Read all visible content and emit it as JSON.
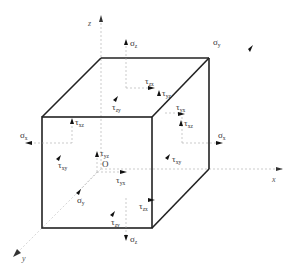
{
  "diagram": {
    "title": "",
    "type": "stress-element-cube",
    "colors": {
      "edge": "#222222",
      "axis": "#999999",
      "arrow": "#111111",
      "text": "#333333",
      "background": "#ffffff"
    },
    "axes": {
      "x": "x",
      "y": "y",
      "z": "z"
    },
    "origin": "O",
    "labels": {
      "top_sigma_z": {
        "sym": "σ",
        "sub": "z"
      },
      "top_tau_zx": {
        "sym": "τ",
        "sub": "zx"
      },
      "top_tau_zy": {
        "sym": "τ",
        "sub": "zy"
      },
      "back_sigma_y": {
        "sym": "σ",
        "sub": "y"
      },
      "back_tau_yz": {
        "sym": "τ",
        "sub": "yz"
      },
      "right_tau_yx": {
        "sym": "τ",
        "sub": "yx"
      },
      "right_tau_xz": {
        "sym": "τ",
        "sub": "xz"
      },
      "right_sigma_x": {
        "sym": "σ",
        "sub": "x"
      },
      "right_tau_xy": {
        "sym": "τ",
        "sub": "xy"
      },
      "left_sigma_x": {
        "sym": "σ",
        "sub": "x"
      },
      "left_tau_xz": {
        "sym": "τ",
        "sub": "xz"
      },
      "left_tau_xy": {
        "sym": "τ",
        "sub": "xy"
      },
      "inner_tau_yz": {
        "sym": "τ",
        "sub": "yz"
      },
      "inner_tau_yx": {
        "sym": "τ",
        "sub": "yx"
      },
      "front_sigma_y": {
        "sym": "σ",
        "sub": "y"
      },
      "front_tau_zx": {
        "sym": "τ",
        "sub": "zx"
      },
      "front_tau_zy": {
        "sym": "τ",
        "sub": "zy"
      },
      "bottom_sigma_z": {
        "sym": "σ",
        "sub": "z"
      }
    }
  }
}
